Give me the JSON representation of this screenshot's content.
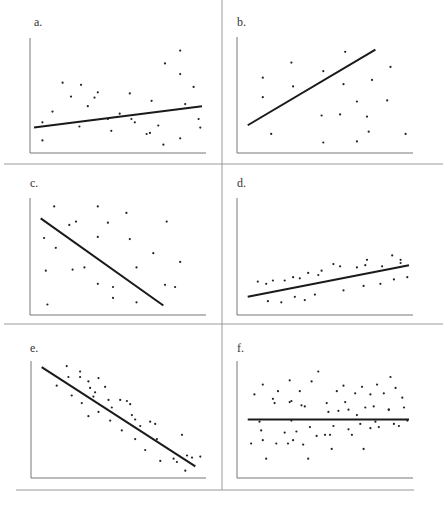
{
  "figure": {
    "layout": "3x2 grid of scatter plots with fitted regression lines",
    "colors": {
      "points": "#222222",
      "line": "#1a1a1a",
      "axes": "#777777",
      "dividers": "#999999"
    }
  },
  "chart_data": [
    {
      "type": "scatter",
      "label": "a.",
      "title": "a.",
      "xlabel": "",
      "ylabel": "",
      "grid": false,
      "trend_line": {
        "x1": 0,
        "y1": 0.2,
        "x2": 1,
        "y2": 0.4
      },
      "x": [
        0.05,
        0.11,
        0.17,
        0.28,
        0.32,
        0.36,
        0.44,
        0.46,
        0.57,
        0.58,
        0.69,
        0.7,
        0.74,
        0.77,
        0.78,
        0.87,
        0.87,
        0.9,
        0.95,
        0.98,
        0.99,
        0.05,
        0.22,
        0.27,
        0.38,
        0.51,
        0.6,
        0.87,
        0.67
      ],
      "y": [
        0.08,
        0.35,
        0.62,
        0.6,
        0.4,
        0.48,
        0.28,
        0.17,
        0.52,
        0.28,
        0.15,
        0.45,
        0.22,
        0.04,
        0.8,
        0.92,
        0.7,
        0.42,
        0.58,
        0.28,
        0.2,
        0.25,
        0.49,
        0.21,
        0.53,
        0.33,
        0.25,
        0.1,
        0.14
      ],
      "xlim": [
        0,
        1
      ],
      "ylim": [
        0,
        1
      ]
    },
    {
      "type": "scatter",
      "label": "b.",
      "title": "b.",
      "xlabel": "",
      "ylabel": "",
      "grid": false,
      "trend_line": {
        "x1": 0.04,
        "y1": 0.22,
        "x2": 0.8,
        "y2": 0.92
      },
      "x": [
        0.13,
        0.13,
        0.18,
        0.3,
        0.31,
        0.49,
        0.49,
        0.59,
        0.61,
        0.62,
        0.69,
        0.69,
        0.75,
        0.76,
        0.78,
        0.87,
        0.89,
        0.98,
        0.48
      ],
      "y": [
        0.66,
        0.48,
        0.14,
        0.8,
        0.58,
        0.72,
        0.06,
        0.32,
        0.6,
        0.9,
        0.44,
        0.07,
        0.3,
        0.16,
        0.64,
        0.45,
        0.76,
        0.14,
        0.31
      ],
      "xlim": [
        0,
        1
      ],
      "ylim": [
        0,
        1
      ]
    },
    {
      "type": "scatter",
      "label": "c.",
      "title": "c.",
      "xlabel": "",
      "ylabel": "",
      "grid": false,
      "trend_line": {
        "x1": 0.04,
        "y1": 0.85,
        "x2": 0.77,
        "y2": 0.05
      },
      "x": [
        0.06,
        0.07,
        0.08,
        0.12,
        0.13,
        0.21,
        0.23,
        0.25,
        0.3,
        0.38,
        0.38,
        0.38,
        0.44,
        0.47,
        0.47,
        0.55,
        0.57,
        0.61,
        0.61,
        0.71,
        0.78,
        0.79,
        0.84,
        0.87
      ],
      "y": [
        0.67,
        0.37,
        0.06,
        0.96,
        0.58,
        0.79,
        0.38,
        0.82,
        0.4,
        0.96,
        0.68,
        0.25,
        0.81,
        0.22,
        0.12,
        0.9,
        0.66,
        0.4,
        0.08,
        0.53,
        0.24,
        0.82,
        0.22,
        0.45
      ],
      "xlim": [
        0,
        1
      ],
      "ylim": [
        0,
        1
      ]
    },
    {
      "type": "scatter",
      "label": "d.",
      "title": "d.",
      "xlabel": "",
      "ylabel": "",
      "grid": false,
      "trend_line": {
        "x1": 0.04,
        "y1": 0.13,
        "x2": 1.0,
        "y2": 0.42
      },
      "x": [
        0.1,
        0.15,
        0.16,
        0.19,
        0.24,
        0.26,
        0.31,
        0.32,
        0.35,
        0.38,
        0.4,
        0.44,
        0.46,
        0.48,
        0.55,
        0.59,
        0.61,
        0.69,
        0.73,
        0.74,
        0.75,
        0.83,
        0.84,
        0.9,
        0.91,
        0.95,
        0.95,
        0.99
      ],
      "y": [
        0.27,
        0.25,
        0.09,
        0.28,
        0.08,
        0.28,
        0.31,
        0.13,
        0.3,
        0.1,
        0.35,
        0.15,
        0.33,
        0.37,
        0.43,
        0.41,
        0.19,
        0.4,
        0.23,
        0.42,
        0.47,
        0.25,
        0.41,
        0.51,
        0.29,
        0.47,
        0.44,
        0.31
      ],
      "xlim": [
        0,
        1
      ],
      "ylim": [
        0,
        1
      ]
    },
    {
      "type": "scatter",
      "label": "e.",
      "title": "e.",
      "xlabel": "",
      "ylabel": "",
      "grid": false,
      "trend_line": {
        "x1": 0.04,
        "y1": 0.98,
        "x2": 0.96,
        "y2": 0.07
      },
      "x": [
        0.13,
        0.19,
        0.2,
        0.22,
        0.27,
        0.27,
        0.28,
        0.32,
        0.32,
        0.33,
        0.35,
        0.36,
        0.38,
        0.38,
        0.42,
        0.44,
        0.45,
        0.46,
        0.51,
        0.52,
        0.55,
        0.57,
        0.58,
        0.6,
        0.6,
        0.63,
        0.66,
        0.69,
        0.72,
        0.73,
        0.75,
        0.83,
        0.85,
        0.88,
        0.9,
        0.91,
        0.94,
        0.99
      ],
      "y": [
        0.81,
        0.99,
        0.89,
        0.72,
        0.94,
        0.89,
        0.65,
        0.85,
        0.53,
        0.79,
        0.71,
        0.75,
        0.88,
        0.57,
        0.8,
        0.68,
        0.49,
        0.61,
        0.68,
        0.4,
        0.67,
        0.64,
        0.54,
        0.32,
        0.5,
        0.44,
        0.22,
        0.48,
        0.46,
        0.32,
        0.12,
        0.14,
        0.11,
        0.36,
        0.03,
        0.17,
        0.15,
        0.16
      ],
      "xlim": [
        0,
        1
      ],
      "ylim": [
        0,
        1
      ]
    },
    {
      "type": "scatter",
      "label": "f.",
      "title": "f.",
      "xlabel": "",
      "ylabel": "",
      "grid": false,
      "trend_line": {
        "x1": 0.04,
        "y1": 0.5,
        "x2": 1.0,
        "y2": 0.5
      },
      "x": [
        0.06,
        0.08,
        0.11,
        0.12,
        0.13,
        0.13,
        0.15,
        0.19,
        0.2,
        0.21,
        0.22,
        0.26,
        0.28,
        0.29,
        0.29,
        0.3,
        0.3,
        0.31,
        0.33,
        0.35,
        0.36,
        0.37,
        0.38,
        0.4,
        0.41,
        0.42,
        0.45,
        0.46,
        0.5,
        0.51,
        0.52,
        0.53,
        0.54,
        0.55,
        0.57,
        0.58,
        0.61,
        0.62,
        0.64,
        0.64,
        0.66,
        0.68,
        0.69,
        0.71,
        0.72,
        0.73,
        0.74,
        0.77,
        0.77,
        0.79,
        0.8,
        0.81,
        0.82,
        0.85,
        0.88,
        0.88,
        0.89,
        0.91,
        0.92,
        0.94,
        0.96,
        0.97,
        0.99
      ],
      "y": [
        0.28,
        0.73,
        0.48,
        0.4,
        0.31,
        0.82,
        0.14,
        0.69,
        0.65,
        0.28,
        0.76,
        0.38,
        0.28,
        0.86,
        0.66,
        0.67,
        0.49,
        0.31,
        0.39,
        0.76,
        0.63,
        0.27,
        0.62,
        0.14,
        0.43,
        0.85,
        0.35,
        0.94,
        0.36,
        0.65,
        0.57,
        0.36,
        0.23,
        0.44,
        0.76,
        0.58,
        0.81,
        0.66,
        0.41,
        0.59,
        0.36,
        0.74,
        0.54,
        0.46,
        0.8,
        0.23,
        0.61,
        0.73,
        0.42,
        0.62,
        0.48,
        0.82,
        0.43,
        0.74,
        0.59,
        0.59,
        0.89,
        0.46,
        0.79,
        0.44,
        0.7,
        0.61,
        0.49
      ],
      "xlim": [
        0,
        1
      ],
      "ylim": [
        0,
        1
      ]
    }
  ]
}
